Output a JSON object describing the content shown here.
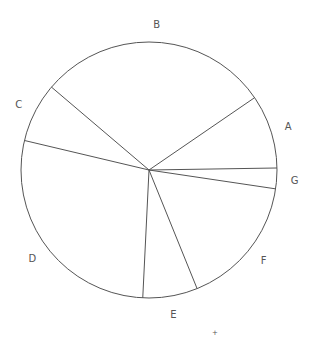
{
  "chart_data": {
    "type": "pie",
    "title": "",
    "categories": [
      "A",
      "B",
      "C",
      "D",
      "E",
      "F",
      "G"
    ],
    "values": [
      9.3,
      29.2,
      7.5,
      27.9,
      6.9,
      16.5,
      2.6
    ],
    "start_angle_deg": 0.9,
    "direction": "counterclockwise",
    "legend": "none",
    "labels_outside": true,
    "fill": "none",
    "stroke_color": "#555555"
  },
  "geometry": {
    "cx": 149,
    "cy": 170,
    "r": 128
  },
  "labels": {
    "A": "A",
    "B": "B",
    "C": "C",
    "D": "D",
    "E": "E",
    "F": "F",
    "G": "G"
  },
  "marker": "+"
}
